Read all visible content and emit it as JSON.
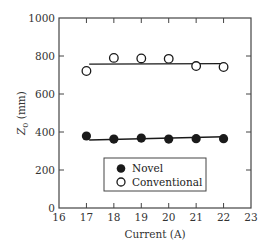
{
  "chart_data": {
    "type": "scatter",
    "title": "",
    "xlabel": "Current (A)",
    "ylabel": "Z0 (mm)",
    "ylabel_main": "Z",
    "ylabel_sub": "0",
    "ylabel_unit": " (mm)",
    "xlim": [
      16,
      23
    ],
    "ylim": [
      0,
      1000
    ],
    "xticks": [
      16,
      17,
      18,
      19,
      20,
      21,
      22,
      23
    ],
    "yticks": [
      0,
      200,
      400,
      600,
      800,
      1000
    ],
    "grid": false,
    "legend_position": "lower center (inside plot)",
    "x": [
      17,
      18,
      19,
      20,
      21,
      22
    ],
    "series": [
      {
        "name": "Novel",
        "marker": "filled-circle",
        "values": [
          379,
          363,
          368,
          363,
          365,
          365
        ],
        "fit_line": {
          "x": [
            17.1,
            22
          ],
          "y": [
            358,
            375
          ]
        }
      },
      {
        "name": "Conventional",
        "marker": "open-circle",
        "values": [
          721,
          790,
          787,
          785,
          747,
          742
        ],
        "fit_line": {
          "x": [
            17.1,
            22
          ],
          "y": [
            757,
            760
          ]
        }
      }
    ]
  },
  "legend": {
    "items": [
      {
        "label": "Novel",
        "marker": "filled-circle"
      },
      {
        "label": "Conventional",
        "marker": "open-circle"
      }
    ]
  },
  "colors": {
    "axis": "#444444",
    "marker": "#1a1a1a",
    "background": "#ffffff"
  }
}
